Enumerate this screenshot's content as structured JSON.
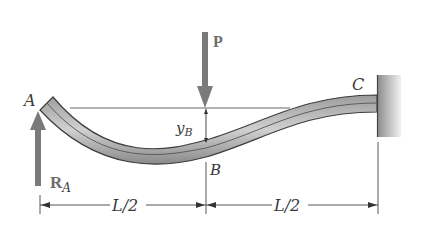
{
  "figure": {
    "points": {
      "A": "A",
      "B": "B",
      "C": "C"
    },
    "load": {
      "label": "P"
    },
    "reaction": {
      "label_main": "R",
      "label_sub": "A"
    },
    "deflection": {
      "label_main": "y",
      "label_sub": "B"
    },
    "dimensions": [
      {
        "label": "L/2",
        "from": "A",
        "to": "B"
      },
      {
        "label": "L/2",
        "from": "B",
        "to": "C"
      }
    ],
    "colors": {
      "arrow": "#7a7a7a",
      "beam_dark": "#4a4a4a",
      "beam_light": "#b8b8b8",
      "wall": "#9a9a9a",
      "line": "#333333"
    }
  }
}
